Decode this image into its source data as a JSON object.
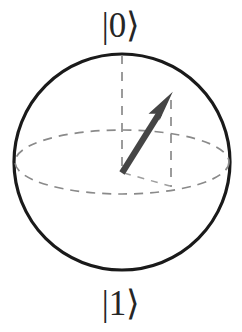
{
  "figure": {
    "name": "Bloch sphere",
    "background_color": "#ffffff"
  },
  "labels": {
    "north_pole": "|0⟩",
    "south_pole": "|1⟩",
    "label_color": "#262626"
  },
  "colors": {
    "sphere_outline": "#1a1a1a",
    "dashed_guide": "#8a8a8a",
    "state_vector": "#454545"
  },
  "chart_data": {
    "type": "scatter",
    "title": "",
    "subtitle": "",
    "xlabel": "",
    "ylabel": "",
    "legend": [],
    "grid": false,
    "geometry": {
      "sphere_center": [
        122,
        162
      ],
      "sphere_radius": 108,
      "equator_rx": 107,
      "equator_ry": 32,
      "north_pole_point": [
        122,
        54
      ],
      "south_pole_point": [
        122,
        270
      ],
      "vector_origin": [
        122,
        172
      ],
      "vector_tip": [
        172,
        93
      ],
      "projection_foot": [
        172,
        185
      ]
    },
    "annotations": [
      {
        "text": "|0⟩",
        "at": [
          122,
          27
        ]
      },
      {
        "text": "|1⟩",
        "at": [
          122,
          305
        ]
      }
    ],
    "series": [
      {
        "name": "state vector",
        "values": [
          {
            "label": "origin",
            "x": 122,
            "y": 172
          },
          {
            "label": "tip",
            "x": 172,
            "y": 93
          }
        ]
      }
    ]
  }
}
